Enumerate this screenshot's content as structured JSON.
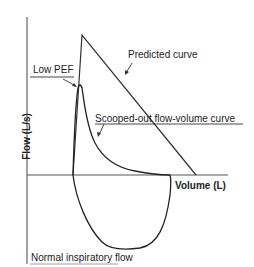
{
  "diagram": {
    "axes": {
      "x_label": "Volume (L)",
      "y_label": "Flow (L/s)"
    },
    "annotations": {
      "low_pef": "Low PEF",
      "predicted_curve": "Predicted curve",
      "scooped_curve": "Scooped-out flow-volume curve",
      "normal_inspiratory": "Normal inspiratory flow"
    },
    "colors": {
      "line": "#333333",
      "axis": "#555555",
      "text": "#222222"
    }
  }
}
